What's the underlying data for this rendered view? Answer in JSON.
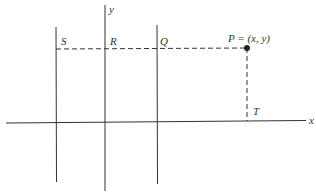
{
  "figure": {
    "axes": {
      "x_label": "x",
      "y_label": "y"
    },
    "points": {
      "S": "S",
      "R": "R",
      "Q": "Q",
      "P": "P = (x, y)",
      "T": "T"
    },
    "colors": {
      "ink": "#333333",
      "background": "#ffffff"
    }
  }
}
